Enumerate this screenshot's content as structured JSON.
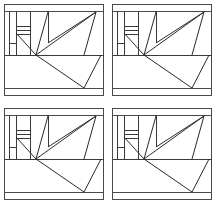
{
  "figure": {
    "background_color": "#ffffff",
    "stroke_color": "#3a3a3a",
    "diagonal_stroke_color": "#2b2b2b",
    "width": 216,
    "height": 208,
    "grid_rows": 2,
    "grid_columns": 2,
    "panel_count": 4
  },
  "panels": [
    {
      "id": "panel-top-left",
      "position": "top-left",
      "row": 1,
      "column": 1
    },
    {
      "id": "panel-top-right",
      "position": "top-right",
      "row": 1,
      "column": 2
    },
    {
      "id": "panel-bottom-left",
      "position": "bottom-left",
      "row": 2,
      "column": 1
    },
    {
      "id": "panel-bottom-right",
      "position": "bottom-right",
      "row": 2,
      "column": 2
    }
  ],
  "geometry": {
    "viewbox": "0 0 108 104",
    "outer_frame": {
      "x": 4,
      "y": 4,
      "width": 100,
      "height": 92
    },
    "top_band": {
      "x": 4,
      "y": 4,
      "width": 100,
      "height": 7
    },
    "bottom_band": {
      "x": 4,
      "y": 89,
      "width": 100,
      "height": 7
    },
    "mid_divider_y": 55,
    "inner_left_x": 9,
    "column_left_x": 16,
    "column_right_x": 30,
    "partition_x": 48,
    "right_inner_x": 96,
    "fan_origin": {
      "x": 36,
      "y": 55
    },
    "ladder_rungs_y": [
      26,
      30,
      34
    ],
    "ladder_x1": 16,
    "ladder_x2": 30,
    "fan_targets": [
      {
        "x": 16,
        "y": 32
      },
      {
        "x": 48,
        "y": 12
      },
      {
        "x": 96,
        "y": 12
      },
      {
        "x": 96,
        "y": 12
      },
      {
        "x": 84,
        "y": 55
      }
    ],
    "big_triangle": [
      {
        "x": 36,
        "y": 55
      },
      {
        "x": 84,
        "y": 88
      },
      {
        "x": 100,
        "y": 55
      }
    ]
  }
}
